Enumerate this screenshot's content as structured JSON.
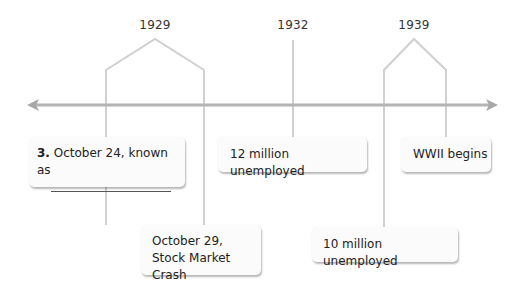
{
  "timeline": {
    "axis": {
      "direction": "both",
      "color": "#b0b0b0"
    },
    "line_color": "#cfcfcf",
    "years": [
      {
        "label": "1929"
      },
      {
        "label": "1932"
      },
      {
        "label": "1939"
      }
    ],
    "events": [
      {
        "number": "3.",
        "text": "October 24, known as",
        "blank": true
      },
      {
        "text": "12 million unemployed"
      },
      {
        "text": "WWII begins"
      },
      {
        "line1": "October 29,",
        "line2": "Stock Market Crash"
      },
      {
        "text": "10 million unemployed"
      }
    ]
  }
}
